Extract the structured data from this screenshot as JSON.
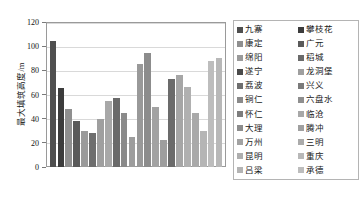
{
  "chart_data": {
    "type": "bar",
    "title": "",
    "xlabel": "",
    "ylabel": "最大填筑高度/m",
    "ylim": [
      0,
      120
    ],
    "ytick_labels": [
      "0",
      "20",
      "40",
      "60",
      "80",
      "100",
      "120"
    ],
    "ytick_values": [
      0,
      20,
      40,
      60,
      80,
      100,
      120
    ],
    "grid": true,
    "legend_position": "right",
    "categories": [
      "九寨",
      "康定",
      "绵阳",
      "遂宁",
      "荔波",
      "铜仁",
      "怀仁",
      "大理",
      "万州",
      "昆明",
      "吕梁",
      "攀枝花",
      "广元",
      "稻城",
      "龙洞堡",
      "兴义",
      "六盘水",
      "临沧",
      "腾冲",
      "三明",
      "重庆",
      "承德"
    ],
    "values": [
      104,
      65,
      48,
      38,
      30,
      28,
      40,
      55,
      57,
      45,
      25,
      85,
      94,
      50,
      22,
      73,
      76,
      66,
      45,
      30,
      88,
      90
    ],
    "bar_colors": [
      "#4f4f4f",
      "#3c3c3c",
      "#8f8f8f",
      "#5a5a5a",
      "#9a9a9a",
      "#6e6e6e",
      "#9f9f9f",
      "#a8a8a8",
      "#6a6a6a",
      "#8a8a8a",
      "#9d9d9d",
      "#999999",
      "#8c8c8c",
      "#a2a2a2",
      "#9e9e9e",
      "#6b6b6b",
      "#a6a6a6",
      "#b0b0b0",
      "#a9a9a9",
      "#b5b5b5",
      "#bdbdbd",
      "#b8b8b8"
    ]
  },
  "legend": {
    "column_left": [
      {
        "label": "九寨",
        "color": "#4f4f4f"
      },
      {
        "label": "康定",
        "color": "#8f8f8f"
      },
      {
        "label": "绵阳",
        "color": "#9a9a9a"
      },
      {
        "label": "遂宁",
        "color": "#4a4a4a"
      },
      {
        "label": "荔波",
        "color": "#6e6e6e"
      },
      {
        "label": "铜仁",
        "color": "#8a8a8a"
      },
      {
        "label": "怀仁",
        "color": "#7d7d7d"
      },
      {
        "label": "大理",
        "color": "#8c8c8c"
      },
      {
        "label": "万州",
        "color": "#a2a2a2"
      },
      {
        "label": "昆明",
        "color": "#aeaeae"
      },
      {
        "label": "吕梁",
        "color": "#b4b4b4"
      }
    ],
    "column_right": [
      {
        "label": "攀枝花",
        "color": "#3c3c3c"
      },
      {
        "label": "广元",
        "color": "#5a5a5a"
      },
      {
        "label": "稻城",
        "color": "#6a6a6a"
      },
      {
        "label": "龙洞堡",
        "color": "#9f9f9f"
      },
      {
        "label": "兴义",
        "color": "#7a7a7a"
      },
      {
        "label": "六盘水",
        "color": "#8f8f8f"
      },
      {
        "label": "临沧",
        "color": "#a8a8a8"
      },
      {
        "label": "腾冲",
        "color": "#a0a0a0"
      },
      {
        "label": "三明",
        "color": "#ababab"
      },
      {
        "label": "重庆",
        "color": "#b8b8b8"
      },
      {
        "label": "承德",
        "color": "#bdbdbd"
      }
    ]
  }
}
